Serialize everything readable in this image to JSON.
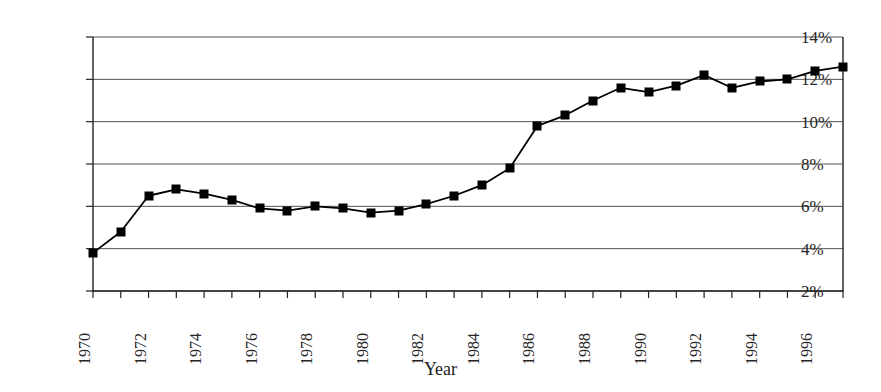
{
  "chart_data": {
    "type": "line",
    "title": "",
    "subtitle": "",
    "xlabel": "Year",
    "ylabel": "",
    "x": [
      1970,
      1971,
      1972,
      1973,
      1974,
      1975,
      1976,
      1977,
      1978,
      1979,
      1980,
      1981,
      1982,
      1983,
      1984,
      1985,
      1986,
      1987,
      1988,
      1989,
      1990,
      1991,
      1992,
      1993,
      1994,
      1995,
      1996,
      1997
    ],
    "values": [
      3.8,
      4.8,
      6.5,
      6.8,
      6.6,
      6.3,
      5.9,
      5.8,
      6.0,
      5.9,
      5.7,
      5.8,
      6.1,
      6.5,
      7.0,
      7.8,
      9.8,
      10.3,
      11.0,
      11.6,
      11.4,
      11.7,
      12.2,
      11.6,
      11.9,
      12.0,
      12.4,
      12.6
    ],
    "series": [
      {
        "name": "series-1",
        "marker": "square",
        "marker_color": "#000000",
        "line_color": "#000000",
        "values": [
          3.8,
          4.8,
          6.5,
          6.8,
          6.6,
          6.3,
          5.9,
          5.8,
          6.0,
          5.9,
          5.7,
          5.8,
          6.1,
          6.5,
          7.0,
          7.8,
          9.8,
          10.3,
          11.0,
          11.6,
          11.4,
          11.7,
          12.2,
          11.6,
          11.9,
          12.0,
          12.4,
          12.6
        ]
      }
    ],
    "ylim": [
      2,
      14
    ],
    "xlim": [
      1970,
      1997
    ],
    "ytick_values": [
      2,
      4,
      6,
      8,
      10,
      12,
      14
    ],
    "ytick_labels": [
      "2%",
      "4%",
      "6%",
      "8%",
      "10%",
      "12%",
      "14%"
    ],
    "xtick_values": [
      1970,
      1972,
      1974,
      1976,
      1978,
      1980,
      1982,
      1984,
      1986,
      1988,
      1990,
      1992,
      1994,
      1996
    ],
    "xtick_labels": [
      "1970",
      "1972",
      "1974",
      "1976",
      "1978",
      "1980",
      "1982",
      "1984",
      "1986",
      "1988",
      "1990",
      "1992",
      "1994",
      "1996"
    ],
    "grid": {
      "horizontal": true,
      "vertical": false,
      "color": "#555555"
    },
    "legend": {
      "visible": false,
      "position": "none",
      "entries": []
    },
    "axes": {
      "left_spine": true,
      "bottom_spine": true,
      "right_spine": true,
      "top_spine": false,
      "spine_color": "#222222"
    },
    "plot_area": {
      "left": 93,
      "right": 843,
      "top": 37,
      "bottom": 291
    }
  }
}
